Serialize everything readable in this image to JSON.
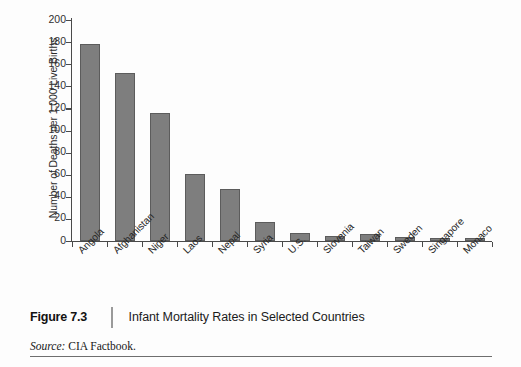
{
  "figure": {
    "number_label": "Figure 7.3",
    "title": "Infant Mortality Rates in Selected Countries",
    "source_prefix": "Source:",
    "source_text": "CIA Factbook."
  },
  "chart_data": {
    "type": "bar",
    "title": "Infant Mortality Rates in Selected Countries",
    "xlabel": "",
    "ylabel": "Number of Deaths per 1,000 Live Births",
    "ylim": [
      0,
      200
    ],
    "ytick_step": 20,
    "yticks": [
      "0",
      "20",
      "40",
      "60",
      "80",
      "100",
      "120",
      "140",
      "160",
      "180",
      "200"
    ],
    "grid": false,
    "legend": null,
    "bar_color": "#7e7e7e",
    "bar_edge_color": "#5c5c5c",
    "axis_color": "#4a4a4a",
    "categories": [
      "Angola",
      "Afghanistan",
      "Niger",
      "Laos",
      "Nepal",
      "Syria",
      "U.S.",
      "Slovenia",
      "Taiwan",
      "Sweden",
      "Singapore",
      "Monaco"
    ],
    "values": [
      178,
      152,
      116,
      61,
      47,
      17,
      7,
      4.5,
      6,
      4,
      2.5,
      2.5
    ],
    "series": [
      {
        "name": "Infant mortality rate",
        "values": [
          178,
          152,
          116,
          61,
          47,
          17,
          7,
          4.5,
          6,
          4,
          2.5,
          2.5
        ]
      }
    ]
  }
}
